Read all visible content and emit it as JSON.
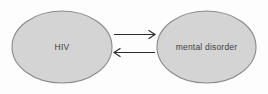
{
  "diagram": {
    "type": "concept-diagram",
    "canvas": {
      "width": 268,
      "height": 94,
      "background_color": "#fdfdfd"
    },
    "style": {
      "node_fill_color": "#d4d4d4",
      "node_border_color": "#8a8a8a",
      "node_text_color": "#3f3f3f",
      "arrow_color": "#2c2c2c"
    },
    "nodes": [
      {
        "id": "hiv",
        "label": "HIV",
        "shape": "ellipse",
        "cx": 62,
        "cy": 47,
        "rx": 50,
        "ry": 36
      },
      {
        "id": "mental-disorder",
        "label": "mental disorder",
        "shape": "ellipse",
        "cx": 206.5,
        "cy": 47,
        "rx": 49.5,
        "ry": 36
      }
    ],
    "edges": [
      {
        "id": "hiv-to-mental-disorder",
        "from": "hiv",
        "to": "mental-disorder",
        "direction": "right",
        "label": "",
        "x1": 114,
        "x2": 155,
        "y": 34.5
      },
      {
        "id": "mental-disorder-to-hiv",
        "from": "mental-disorder",
        "to": "hiv",
        "direction": "left",
        "label": "",
        "x1": 155,
        "x2": 114,
        "y": 52.5
      }
    ]
  }
}
